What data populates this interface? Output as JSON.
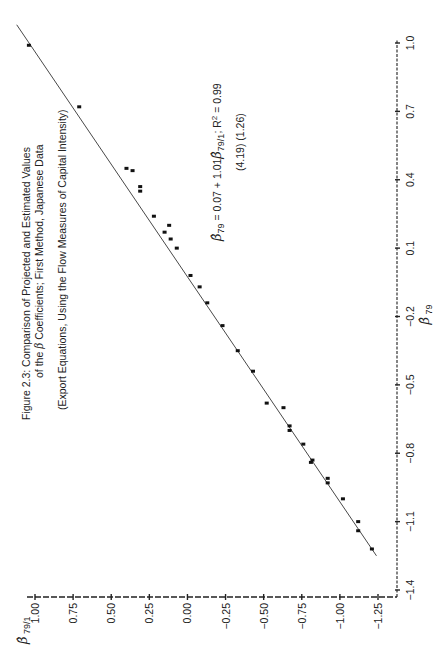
{
  "figure": {
    "caption_line1": "Figure 2.3:  Comparison of Projected and Estimated Values",
    "caption_line2_prefix": "of the ",
    "caption_line2_beta": "β",
    "caption_line2_suffix": " Coefficients;  First Method, Japanese Data",
    "caption_line3": "(Export Equations, Using the Flow Measures of Capital Intensity)",
    "equation": {
      "lhs_symbol": "β̂",
      "lhs_sub": "79",
      "rhs_text": " = 0.07 + 1.01",
      "rhs_symbol": "β̂",
      "rhs_sub": "79/1",
      "r2_label": ";  R",
      "r2_sup": "2",
      "r2_value": " = 0.99",
      "t_stats": "(4.19)  (1.26)"
    }
  },
  "chart_data": {
    "type": "scatter",
    "title": "Figure 2.3: Comparison of Projected and Estimated Values of the β Coefficients; First Method, Japanese Data (Export Equations, Using the Flow Measures of Capital Intensity)",
    "xlabel": "β̂ 79",
    "ylabel": "β̂ 79/1",
    "xlim": [
      -1.4,
      1.0
    ],
    "ylim": [
      -1.25,
      1.0
    ],
    "x_ticks": [
      -1.4,
      -1.1,
      -0.8,
      -0.5,
      -0.2,
      0.1,
      0.4,
      0.7,
      1.0
    ],
    "x_tick_labels": [
      "−1.4",
      "−1.1",
      "−0.8",
      "−0.5",
      "−0.2",
      "0.1",
      "0.4",
      "0.7",
      "1.0"
    ],
    "y_ticks": [
      1.0,
      0.75,
      0.5,
      0.25,
      0.0,
      -0.25,
      -0.5,
      -0.75,
      -1.0,
      -1.25
    ],
    "y_tick_labels": [
      "1.00",
      "0.75",
      "0.50",
      "0.25",
      "0.00",
      "−0.25",
      "−0.50",
      "−0.75",
      "−1.00",
      "−1.25"
    ],
    "grid": false,
    "orientation": "rotated 90° counter-clockwise on page",
    "points": [
      {
        "x": 0.99,
        "y": 1.04
      },
      {
        "x": 0.72,
        "y": 0.71
      },
      {
        "x": 0.45,
        "y": 0.4
      },
      {
        "x": 0.44,
        "y": 0.36
      },
      {
        "x": 0.37,
        "y": 0.31
      },
      {
        "x": 0.35,
        "y": 0.31
      },
      {
        "x": 0.24,
        "y": 0.22
      },
      {
        "x": 0.2,
        "y": 0.12
      },
      {
        "x": 0.17,
        "y": 0.15
      },
      {
        "x": 0.14,
        "y": 0.11
      },
      {
        "x": 0.1,
        "y": 0.07
      },
      {
        "x": -0.02,
        "y": -0.02
      },
      {
        "x": -0.07,
        "y": -0.08
      },
      {
        "x": -0.14,
        "y": -0.13
      },
      {
        "x": -0.24,
        "y": -0.23
      },
      {
        "x": -0.35,
        "y": -0.33
      },
      {
        "x": -0.44,
        "y": -0.43
      },
      {
        "x": -0.58,
        "y": -0.52
      },
      {
        "x": -0.6,
        "y": -0.63
      },
      {
        "x": -0.68,
        "y": -0.67
      },
      {
        "x": -0.7,
        "y": -0.67
      },
      {
        "x": -0.76,
        "y": -0.76
      },
      {
        "x": -0.83,
        "y": -0.82
      },
      {
        "x": -0.84,
        "y": -0.81
      },
      {
        "x": -0.91,
        "y": -0.92
      },
      {
        "x": -0.93,
        "y": -0.92
      },
      {
        "x": -1.0,
        "y": -1.02
      },
      {
        "x": -1.1,
        "y": -1.12
      },
      {
        "x": -1.14,
        "y": -1.12
      },
      {
        "x": -1.22,
        "y": -1.21
      }
    ],
    "fit_line": {
      "intercept": 0.07,
      "slope": 1.01,
      "note": "fitted line drawn approximately along y ≈ x"
    },
    "annotations": [
      "β̂79 = 0.07 + 1.01 β̂79/1;  R² = 0.99",
      "(4.19)  (1.26)"
    ]
  }
}
